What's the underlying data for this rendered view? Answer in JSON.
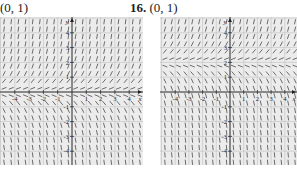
{
  "panels": [
    {
      "number": "",
      "point_label": "(0, 1)",
      "box": {
        "left": 0,
        "width": 143
      },
      "axis_origin_px": {
        "x": 72,
        "y": 75
      }
    },
    {
      "number": "16.",
      "point_label": "(0, 1)",
      "box": {
        "left": 160,
        "width": 137
      },
      "axis_origin_px": {
        "x": 70,
        "y": 75
      }
    }
  ],
  "chart_data": [
    {
      "type": "slope_field",
      "title": "(0, 1)",
      "xlabel": "x",
      "ylabel": "y",
      "xlim": [
        -5,
        5
      ],
      "ylim": [
        -5,
        5
      ],
      "grid": true,
      "x_ticks": [
        -4,
        -3,
        -2,
        -1,
        1,
        2,
        3,
        4
      ],
      "y_ticks": [
        -4,
        -3,
        -2,
        -1,
        1,
        2,
        3,
        4
      ],
      "equilibrium_y": 0,
      "description": "Slopes positive above y=0, zero along y=0, negative below; steepness grows with |y|"
    },
    {
      "type": "slope_field",
      "title": "16. (0, 1)",
      "xlabel": "x",
      "ylabel": "y",
      "xlim": [
        -5,
        5
      ],
      "ylim": [
        -5,
        5
      ],
      "grid": true,
      "x_ticks": [
        -4,
        -3,
        -2,
        -1,
        1,
        2,
        3,
        4
      ],
      "y_ticks": [
        -4,
        -3,
        -2,
        -1,
        1,
        2,
        3,
        4
      ],
      "equilibrium_y": 2,
      "description": "Slopes positive above y=2, zero along y=2, negative below; steepness grows with distance from y=2"
    }
  ]
}
